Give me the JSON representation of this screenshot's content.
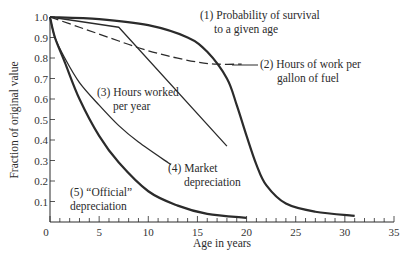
{
  "chart_data": {
    "type": "line",
    "title": "",
    "xlabel": "Age in years",
    "ylabel": "Fraction of original value",
    "xlim": [
      0,
      35
    ],
    "ylim": [
      0,
      1.0
    ],
    "x_ticks": [
      0,
      5,
      10,
      15,
      20,
      25,
      30,
      35
    ],
    "y_ticks": [
      0.1,
      0.2,
      0.3,
      0.4,
      0.5,
      0.6,
      0.7,
      0.8,
      0.9,
      1.0
    ],
    "y_tick_labels": [
      "0.1",
      "0.2",
      "0.3",
      "0.4",
      "0.5",
      "0.6",
      "0.7",
      "0.8",
      "0.9",
      "1.0"
    ],
    "grid": false,
    "legend": "inline annotations",
    "series": [
      {
        "name": "(1) Probability of survival to a given age",
        "style": "solid-thick",
        "x": [
          0,
          5,
          10,
          14,
          16,
          18,
          19,
          20,
          21,
          22,
          24,
          27,
          31
        ],
        "y": [
          1.0,
          0.99,
          0.96,
          0.9,
          0.83,
          0.7,
          0.57,
          0.42,
          0.28,
          0.18,
          0.09,
          0.05,
          0.03
        ]
      },
      {
        "name": "(2) Hours of work per gallon of fuel",
        "style": "dashed",
        "x": [
          0,
          3,
          6,
          9,
          12,
          15,
          17,
          19.5
        ],
        "y": [
          1.0,
          0.95,
          0.9,
          0.85,
          0.81,
          0.78,
          0.77,
          0.77
        ]
      },
      {
        "name": "(3) Hours worked per year",
        "style": "solid-thin",
        "x": [
          0,
          7,
          18
        ],
        "y": [
          1.0,
          0.95,
          0.37
        ]
      },
      {
        "name": "(4) Market depreciation",
        "style": "solid-thin",
        "x": [
          0,
          0.5,
          1.5,
          3,
          5,
          7,
          9,
          12.3
        ],
        "y": [
          1.0,
          0.9,
          0.8,
          0.68,
          0.57,
          0.47,
          0.39,
          0.28
        ]
      },
      {
        "name": "(5) “Official” depreciation",
        "style": "solid-thick",
        "x": [
          0,
          0.5,
          1.5,
          3,
          5,
          7,
          10,
          13,
          16,
          20
        ],
        "y": [
          1.0,
          0.9,
          0.78,
          0.6,
          0.42,
          0.29,
          0.15,
          0.08,
          0.04,
          0.02
        ]
      }
    ],
    "annotations": [
      {
        "series": 1,
        "lines": [
          "(1) Probability of survival",
          "to a given age"
        ]
      },
      {
        "series": 2,
        "lines": [
          "(2) Hours of work per",
          "gallon of fuel"
        ]
      },
      {
        "series": 3,
        "lines": [
          "(3) Hours worked",
          "per year"
        ]
      },
      {
        "series": 4,
        "lines": [
          "(4) Market",
          "depreciation"
        ]
      },
      {
        "series": 5,
        "lines": [
          "(5) “Official”",
          "depreciation"
        ]
      }
    ]
  },
  "labels": {
    "xlabel": "Age in years",
    "ylabel": "Fraction of original value",
    "ann1_l1": "(1) Probability of survival",
    "ann1_l2": "to a given age",
    "ann2_l1": "(2) Hours of work per",
    "ann2_l2": "gallon of fuel",
    "ann3_l1": "(3) Hours worked",
    "ann3_l2": "per year",
    "ann4_l1": "(4) Market",
    "ann4_l2": "depreciation",
    "ann5_l1": "(5) “Official”",
    "ann5_l2": "depreciation"
  }
}
